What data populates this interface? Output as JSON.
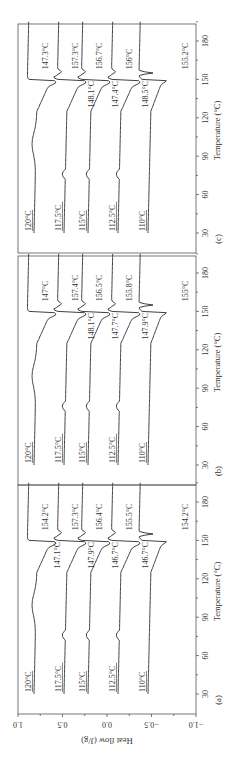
{
  "chart_data": [
    {
      "type": "line",
      "panel_label": "(a)",
      "xlabel": "Temperature (°C)",
      "ylabel": "Heat flow (J/g)",
      "xticks": [
        30,
        60,
        90,
        120,
        150,
        180
      ],
      "yticks": [
        "1.0",
        "0.5",
        "0.0",
        "−0.5",
        "−1.0"
      ],
      "xlim": [
        20,
        200
      ],
      "ylim": [
        -1.0,
        1.0
      ],
      "series": [
        {
          "name": "120°C",
          "offset": 0.83,
          "peak_low": "147.1°C",
          "peak_high": "154.2°C"
        },
        {
          "name": "117.5°C",
          "offset": 0.52,
          "peak_low": "147.9°C",
          "peak_high": "157.3°C"
        },
        {
          "name": "115°C",
          "offset": 0.14,
          "peak_low": "146.7°C",
          "peak_high": "156.4°C"
        },
        {
          "name": "112.5°C",
          "offset": -0.19,
          "peak_low": "146.7°C",
          "peak_high": "155.5°C"
        },
        {
          "name": "110°C",
          "offset": -0.56,
          "peak_low": "",
          "peak_high": "154.2°C"
        }
      ]
    },
    {
      "type": "line",
      "panel_label": "(b)",
      "xlabel": "Temperature (°C)",
      "xticks": [
        30,
        60,
        90,
        120,
        150,
        180
      ],
      "xlim": [
        20,
        200
      ],
      "series": [
        {
          "name": "120°C",
          "offset": 0.83,
          "peak_low": "",
          "peak_high": "147°C"
        },
        {
          "name": "117.5°C",
          "offset": 0.52,
          "peak_low": "148.1°C",
          "peak_high": "157.4°C"
        },
        {
          "name": "115°C",
          "offset": 0.14,
          "peak_low": "147.7°C",
          "peak_high": "156.5°C"
        },
        {
          "name": "112.5°C",
          "offset": -0.19,
          "peak_low": "147.9°C",
          "peak_high": "155.8°C"
        },
        {
          "name": "110°C",
          "offset": -0.56,
          "peak_low": "",
          "peak_high": "155°C"
        }
      ]
    },
    {
      "type": "line",
      "panel_label": "(c)",
      "xlabel": "Temperature (°C)",
      "xticks": [
        30,
        60,
        90,
        120,
        150,
        180
      ],
      "xlim": [
        20,
        200
      ],
      "series": [
        {
          "name": "120°C",
          "offset": 0.83,
          "peak_low": "",
          "peak_high": "147.3°C"
        },
        {
          "name": "117.5°C",
          "offset": 0.52,
          "peak_low": "148.1°C",
          "peak_high": "157.3°C"
        },
        {
          "name": "115°C",
          "offset": 0.14,
          "peak_low": "147.4°C",
          "peak_high": "156.7°C"
        },
        {
          "name": "112.5°C",
          "offset": -0.19,
          "peak_low": "148.5°C",
          "peak_high": "156°C"
        },
        {
          "name": "110°C",
          "offset": -0.56,
          "peak_low": "",
          "peak_high": "155.2°C"
        }
      ]
    }
  ]
}
